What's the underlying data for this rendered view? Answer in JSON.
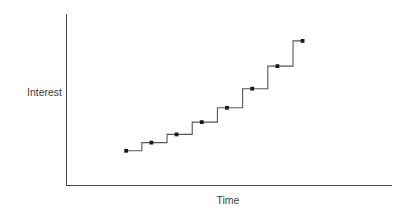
{
  "chart_data": {
    "type": "line",
    "title": "",
    "subtitle": "",
    "xlabel": "Time",
    "ylabel": "Interest",
    "grid": false,
    "legend": null,
    "style": "step-post",
    "axis_ticks": false,
    "axis_tick_labels": false,
    "xlim": [
      0,
      10
    ],
    "ylim": [
      0,
      10
    ],
    "series": [
      {
        "name": "Interest",
        "marker": "filled-square-dot",
        "line_color": "#555555",
        "marker_color": "#1a1a1a",
        "x": [
          1,
          2,
          3,
          4,
          5,
          6,
          7,
          8
        ],
        "values": [
          1.15,
          1.75,
          2.35,
          3.25,
          4.3,
          5.7,
          7.35,
          9.2
        ]
      }
    ],
    "annotations": []
  },
  "axes": {
    "y_axis_label": "Interest",
    "x_axis_label": "Time",
    "axis_color": "#4a4a4a"
  },
  "colors": {
    "background": "#ffffff",
    "line": "#555555",
    "marker": "#1a1a1a",
    "axis": "#4a4a4a",
    "text": "#3a3a3a"
  }
}
